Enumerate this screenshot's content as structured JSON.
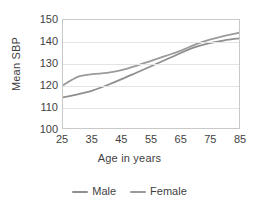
{
  "chart_data": {
    "type": "line",
    "title": "",
    "xlabel": "Age in years",
    "ylabel": "Mean SBP",
    "xlim": [
      25,
      85
    ],
    "ylim": [
      100,
      150
    ],
    "grid": true,
    "legend_position": "bottom",
    "x": [
      25,
      30,
      35,
      40,
      45,
      50,
      55,
      60,
      65,
      70,
      75,
      80,
      85
    ],
    "yticks": [
      100,
      110,
      120,
      130,
      140,
      150
    ],
    "xticks": [
      25,
      35,
      45,
      55,
      65,
      75,
      85
    ],
    "series": [
      {
        "name": "Male",
        "color": "#8f8f8f",
        "values": [
          114.2,
          115.6,
          117.3,
          119.8,
          122.6,
          125.6,
          128.6,
          131.6,
          134.6,
          137.4,
          139.3,
          140.6,
          141.5
        ]
      },
      {
        "name": "Female",
        "color": "#9b9b9b",
        "values": [
          119.8,
          123.7,
          124.9,
          125.5,
          126.8,
          128.8,
          131.1,
          133.4,
          135.7,
          138.6,
          140.9,
          142.7,
          144.1
        ]
      }
    ]
  },
  "axes": {
    "y_title": "Mean SBP",
    "x_title": "Age in years",
    "y_tick_labels": [
      "150",
      "140",
      "130",
      "120",
      "110",
      "100"
    ],
    "x_tick_labels": [
      "25",
      "35",
      "45",
      "55",
      "65",
      "75",
      "85"
    ]
  },
  "legend": {
    "items": [
      {
        "label": "Male",
        "color": "#8f8f8f"
      },
      {
        "label": "Female",
        "color": "#9b9b9b"
      }
    ]
  },
  "colors": {
    "frame": "#c9c9c9",
    "grid": "#e4e4e4",
    "text": "#3f3f3f",
    "background": "#ffffff"
  }
}
